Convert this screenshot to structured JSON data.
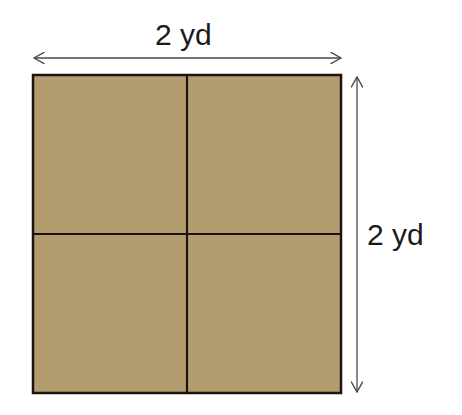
{
  "diagram": {
    "top_label": "2 yd",
    "side_label": "2 yd",
    "grid": {
      "rows": 2,
      "cols": 2
    },
    "colors": {
      "fill": "#b39c6f",
      "border": "#1c1410",
      "arrow": "#4a4a4a",
      "background": "#ffffff"
    }
  }
}
